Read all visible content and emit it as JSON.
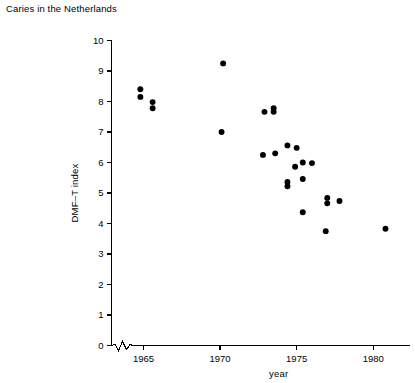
{
  "figure": {
    "caption": "Caries in the Netherlands"
  },
  "chart_data": {
    "type": "scatter",
    "title": "Caries in the Netherlands",
    "xlabel": "year",
    "ylabel": "DMF–T index",
    "xlim": [
      1963.6,
      1982.4
    ],
    "ylim": [
      0,
      10
    ],
    "grid": false,
    "legend": null,
    "axis_break": {
      "axis": "x",
      "between": [
        1963.6,
        1964.6
      ],
      "style": "zigzag"
    },
    "xticks": [
      1965,
      1970,
      1975,
      1980
    ],
    "xtick_labels": [
      "1965",
      "1970",
      "1975",
      "1980"
    ],
    "yticks": [
      0,
      1,
      2,
      3,
      4,
      5,
      6,
      7,
      8,
      9,
      10
    ],
    "ytick_labels": [
      "0",
      "1",
      "2",
      "3",
      "4",
      "5",
      "6",
      "7",
      "8",
      "9",
      "10"
    ],
    "marker": "filled-circle",
    "marker_color": "#000000",
    "marker_size_px": 4.4,
    "points": [
      {
        "x": 1964.8,
        "y": 8.4
      },
      {
        "x": 1964.8,
        "y": 8.15
      },
      {
        "x": 1965.6,
        "y": 7.98
      },
      {
        "x": 1965.6,
        "y": 7.78
      },
      {
        "x": 1970.2,
        "y": 9.25
      },
      {
        "x": 1970.1,
        "y": 7.0
      },
      {
        "x": 1972.9,
        "y": 7.66
      },
      {
        "x": 1973.5,
        "y": 7.78
      },
      {
        "x": 1973.5,
        "y": 7.66
      },
      {
        "x": 1972.8,
        "y": 6.25
      },
      {
        "x": 1973.6,
        "y": 6.3
      },
      {
        "x": 1974.4,
        "y": 6.56
      },
      {
        "x": 1975.0,
        "y": 6.48
      },
      {
        "x": 1974.9,
        "y": 5.86
      },
      {
        "x": 1975.4,
        "y": 6.0
      },
      {
        "x": 1976.0,
        "y": 5.98
      },
      {
        "x": 1974.4,
        "y": 5.36
      },
      {
        "x": 1974.4,
        "y": 5.22
      },
      {
        "x": 1975.4,
        "y": 5.46
      },
      {
        "x": 1975.4,
        "y": 4.37
      },
      {
        "x": 1977.0,
        "y": 4.84
      },
      {
        "x": 1977.0,
        "y": 4.66
      },
      {
        "x": 1977.8,
        "y": 4.74
      },
      {
        "x": 1976.9,
        "y": 3.75
      },
      {
        "x": 1980.8,
        "y": 3.83
      }
    ]
  }
}
